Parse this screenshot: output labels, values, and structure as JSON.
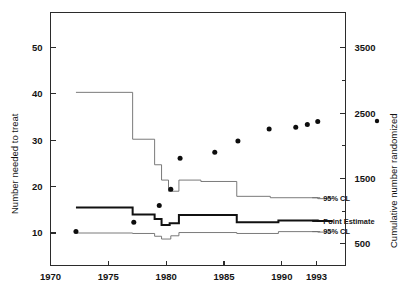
{
  "chart_data": {
    "type": "line",
    "title": "",
    "subtitle": "",
    "xlabel": "",
    "ylabel": "Number needed to treat",
    "y2label": "Cumulative number randomized",
    "xlim": [
      1970,
      1995.5
    ],
    "ylim": [
      3.0,
      57.5
    ],
    "y2lim": [
      170,
      4040
    ],
    "grid": false,
    "legend_position": "inline-right",
    "xticks": [
      1970,
      1975,
      1980,
      1985,
      1990,
      1993
    ],
    "xticklabels": [
      "1970",
      "1975",
      "1980",
      "1985",
      "1990",
      "1993"
    ],
    "yticks": [
      10,
      20,
      30,
      40,
      50
    ],
    "yticklabels": [
      "10",
      "20",
      "30",
      "40",
      "50"
    ],
    "y2ticks": [
      500,
      1000,
      1500,
      2000,
      2500,
      3000,
      3500
    ],
    "y2ticklabels": [
      "500",
      "",
      "1500",
      "",
      "2500",
      "",
      "3500"
    ],
    "series": [
      {
        "name": "95% CL",
        "role": "upper-confidence-limit",
        "style": "step",
        "line_weight": "thin",
        "color": "#6b6b6b",
        "label": "95% CL",
        "label_x": 1993.4,
        "label_y": 17.6,
        "x": [
          1972.2,
          1977.1,
          1977.1,
          1979.0,
          1979.0,
          1979.6,
          1979.6,
          1980.2,
          1980.2,
          1981.1,
          1981.1,
          1983.0,
          1983.0,
          1986.1,
          1986.1,
          1989.0,
          1989.0,
          1993.1,
          1993.1,
          1994.4
        ],
        "y": [
          40.3,
          40.3,
          30.2,
          30.2,
          24.7,
          24.7,
          21.4,
          21.4,
          19.0,
          19.0,
          21.4,
          21.4,
          21.1,
          21.1,
          17.9,
          17.9,
          17.6,
          17.6,
          17.4,
          17.4
        ]
      },
      {
        "name": "Point Estimate",
        "role": "point-estimate",
        "style": "step",
        "line_weight": "bold",
        "color": "#111111",
        "label": "Point Estimate",
        "label_x": 1993.4,
        "label_y": 12.6,
        "x": [
          1972.2,
          1977.1,
          1977.1,
          1979.0,
          1979.0,
          1979.6,
          1979.6,
          1980.3,
          1980.3,
          1981.1,
          1981.1,
          1986.1,
          1986.1,
          1989.7,
          1989.7,
          1993.1,
          1993.1,
          1994.4
        ],
        "y": [
          15.5,
          15.5,
          14.0,
          14.0,
          13.0,
          13.0,
          11.7,
          11.7,
          12.1,
          12.1,
          13.9,
          13.9,
          12.3,
          12.3,
          12.7,
          12.7,
          12.6,
          12.6
        ]
      },
      {
        "name": "95% CL",
        "role": "lower-confidence-limit",
        "style": "step",
        "line_weight": "thin",
        "color": "#6b6b6b",
        "label": "95% CL",
        "label_x": 1993.4,
        "label_y": 10.3,
        "x": [
          1972.2,
          1977.1,
          1977.1,
          1979.0,
          1979.0,
          1979.6,
          1979.6,
          1980.4,
          1980.4,
          1981.1,
          1981.1,
          1986.1,
          1986.1,
          1989.7,
          1989.7,
          1993.1,
          1993.1,
          1994.4
        ],
        "y": [
          10.0,
          10.0,
          9.9,
          9.9,
          9.3,
          9.3,
          8.7,
          8.7,
          9.4,
          9.4,
          10.1,
          10.1,
          9.9,
          9.9,
          10.3,
          10.3,
          10.2,
          10.2
        ]
      }
    ],
    "scatter": {
      "name": "Cumulative number randomized",
      "role": "cumulative-randomized-points",
      "marker": "filled-circle",
      "color": "#0d0d0d",
      "axis": "right",
      "points": [
        {
          "x": 1972.2,
          "y_right": 790,
          "y_left": 10.3
        },
        {
          "x": 1977.2,
          "y_right": 1020,
          "y_left": 12.3
        },
        {
          "x": 1979.4,
          "y_right": 1300,
          "y_left": 15.9
        },
        {
          "x": 1980.4,
          "y_right": 1560,
          "y_left": 19.4
        },
        {
          "x": 1981.2,
          "y_right": 2090,
          "y_left": 26.1
        },
        {
          "x": 1984.2,
          "y_right": 2190,
          "y_left": 27.4
        },
        {
          "x": 1986.2,
          "y_right": 2380,
          "y_left": 29.8
        },
        {
          "x": 1988.9,
          "y_right": 2590,
          "y_left": 32.4
        },
        {
          "x": 1991.2,
          "y_right": 2620,
          "y_left": 32.8
        },
        {
          "x": 1992.2,
          "y_right": 2680,
          "y_left": 33.4
        },
        {
          "x": 1993.1,
          "y_right": 2730,
          "y_left": 34.0
        }
      ],
      "legend_marker": {
        "x_px": 377,
        "y_px": 121
      }
    },
    "colors": {
      "axis": "#2b2b2b",
      "thin_line": "#6b6b6b",
      "bold_line": "#111111",
      "marker": "#0d0d0d",
      "background": "#ffffff"
    }
  }
}
